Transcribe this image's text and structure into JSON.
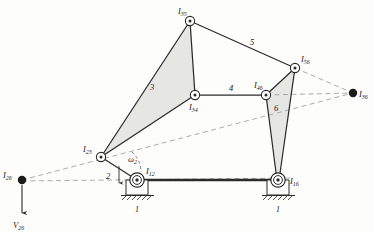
{
  "figure": {
    "type": "kinematic-linkage-instant-center-diagram",
    "background_color": "#fdfdfc",
    "line_color": "#2b2b2b",
    "dashed_color": "#9a9a9a",
    "shade_color": "#e3e3e1"
  },
  "nodes": [
    {
      "id": "I35",
      "label_main": "I",
      "label_sub": "35",
      "x": 190,
      "y": 21,
      "kind": "pin-circle",
      "label_dx": -12,
      "label_dy": -7
    },
    {
      "id": "I34",
      "label_main": "I",
      "label_sub": "34",
      "x": 195,
      "y": 95,
      "kind": "pin-circle",
      "label_dx": -4,
      "label_dy": 14
    },
    {
      "id": "I23",
      "label_main": "I",
      "label_sub": "23",
      "x": 101,
      "y": 157,
      "kind": "pin-circle",
      "label_dx": -14,
      "label_dy": -6
    },
    {
      "id": "I46",
      "label_main": "I",
      "label_sub": "46",
      "x": 266,
      "y": 95,
      "kind": "pin-circle",
      "label_dx": -7,
      "label_dy": -8
    },
    {
      "id": "I56",
      "label_main": "I",
      "label_sub": "56",
      "x": 295,
      "y": 68,
      "kind": "pin-circle",
      "label_dx": 7,
      "label_dy": -5
    },
    {
      "id": "I12",
      "label_main": "I",
      "label_sub": "12",
      "x": 137,
      "y": 180,
      "kind": "ground-pivot",
      "label_dx": 11,
      "label_dy": -4
    },
    {
      "id": "I16",
      "label_main": "I",
      "label_sub": "16",
      "x": 278,
      "y": 180,
      "kind": "ground-pivot",
      "label_dx": 12,
      "label_dy": 3
    },
    {
      "id": "I26",
      "label_main": "I",
      "label_sub": "26",
      "x": 22,
      "y": 180,
      "kind": "filled-dot",
      "label_dx": -14,
      "label_dy": -3
    },
    {
      "id": "I36",
      "label_main": "I",
      "label_sub": "36",
      "x": 353,
      "y": 93,
      "kind": "filled-dot",
      "label_dx": 6,
      "label_dy": 4
    }
  ],
  "link_labels": [
    {
      "id": "link-2",
      "text": "2",
      "x": 111,
      "y": 176
    },
    {
      "id": "link-3",
      "text": "3",
      "x": 152,
      "y": 87
    },
    {
      "id": "link-4",
      "text": "4",
      "x": 231,
      "y": 88
    },
    {
      "id": "link-5",
      "text": "5",
      "x": 252,
      "y": 42
    },
    {
      "id": "link-6",
      "text": "6",
      "x": 275,
      "y": 108
    },
    {
      "id": "ground-left",
      "text": "1",
      "x": 137,
      "y": 206
    },
    {
      "id": "ground-right",
      "text": "1",
      "x": 278,
      "y": 206
    }
  ],
  "annotations": {
    "omega": {
      "id": "omega-2",
      "symbol": "ω",
      "sub": "2",
      "x": 131,
      "y": 160
    },
    "velocity": {
      "id": "V26",
      "symbol": "V",
      "sub": "26",
      "x": 16,
      "y": 228
    }
  },
  "solid_links": [
    {
      "id": "link2-crank",
      "from": "I12",
      "to": "I23"
    },
    {
      "id": "link3-a",
      "from": "I23",
      "to": "I35"
    },
    {
      "id": "link3-b",
      "from": "I23",
      "to": "I34"
    },
    {
      "id": "link3-c",
      "from": "I35",
      "to": "I34"
    },
    {
      "id": "link4-coupler",
      "from": "I34",
      "to": "I46"
    },
    {
      "id": "link5-coupler",
      "from": "I35",
      "to": "I56"
    },
    {
      "id": "link6-a",
      "from": "I46",
      "to": "I56"
    },
    {
      "id": "link6-b",
      "from": "I46",
      "to": "I16"
    },
    {
      "id": "link6-c",
      "from": "I56",
      "to": "I16"
    },
    {
      "id": "link1-ground",
      "from": "I12",
      "to": "I16"
    }
  ],
  "dashed_lines": [
    {
      "id": "dash-I26-I12",
      "from": "I26",
      "to": "I16"
    },
    {
      "id": "dash-I26-I23-I36",
      "from": "I26",
      "to": "I36"
    },
    {
      "id": "dash-I56-I36",
      "from": "I56",
      "to": "I36"
    },
    {
      "id": "dash-I46-I36",
      "from": "I46",
      "to": "I36"
    }
  ],
  "shaded_polygons": [
    {
      "id": "ternary-link-3",
      "points": "101,157 190,21 195,95"
    },
    {
      "id": "ternary-link-6",
      "points": "266,95 295,68 278,180"
    }
  ]
}
